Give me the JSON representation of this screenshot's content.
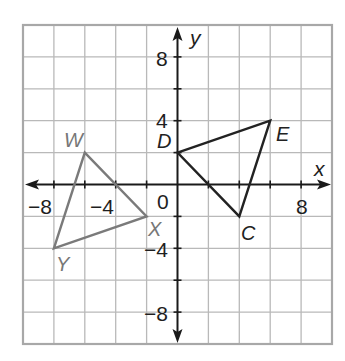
{
  "figure": {
    "type": "coordinate-plane",
    "x_axis": {
      "label": "x",
      "min": -10,
      "max": 10,
      "grid_step": 2
    },
    "y_axis": {
      "label": "y",
      "min": -10,
      "max": 10,
      "grid_step": 2
    },
    "tick_labels": {
      "x": [
        {
          "value": -8,
          "text": "−8"
        },
        {
          "value": -4,
          "text": "−4"
        },
        {
          "value": 8,
          "text": "8"
        }
      ],
      "y": [
        {
          "value": 8,
          "text": "8"
        },
        {
          "value": 4,
          "text": "4"
        },
        {
          "value": -4,
          "text": "−4"
        },
        {
          "value": -8,
          "text": "−8"
        }
      ],
      "origin": "0"
    },
    "colors": {
      "grid": "#b9b9b9",
      "border": "#a8a8a8",
      "axes": "#1a1a1a",
      "triangle_dec": "#222222",
      "triangle_wxy": "#7a7a7a"
    },
    "triangles": [
      {
        "name": "DEC",
        "color": "#222222",
        "vertices": [
          {
            "label": "D",
            "x": 0,
            "y": 2
          },
          {
            "label": "E",
            "x": 6,
            "y": 4
          },
          {
            "label": "C",
            "x": 4,
            "y": -2
          }
        ]
      },
      {
        "name": "WXY",
        "color": "#7a7a7a",
        "vertices": [
          {
            "label": "W",
            "x": -6,
            "y": 2
          },
          {
            "label": "X",
            "x": -2,
            "y": -2
          },
          {
            "label": "Y",
            "x": -8,
            "y": -4
          }
        ]
      }
    ]
  }
}
